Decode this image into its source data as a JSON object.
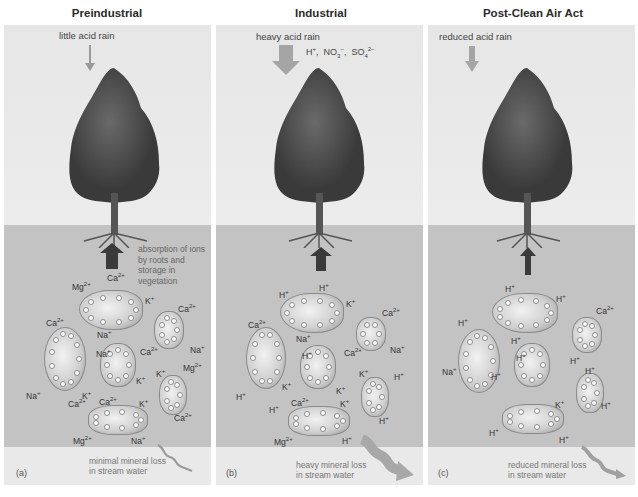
{
  "panels": [
    {
      "letter": "(a)",
      "title": "Preindustrial",
      "rain_label": "little acid rain",
      "absorption_label": "absorption of ions by roots and storage in vegetation",
      "loss_label_1": "minimal mineral loss",
      "loss_label_2": "in stream water",
      "ions": [
        "Mg2+",
        "Ca2+",
        "K+",
        "Ca2+",
        "Ca2+",
        "Na+",
        "Na+",
        "Na+",
        "Ca2+",
        "Na+",
        "K+",
        "K+",
        "K+",
        "Mg2+",
        "Ca2+",
        "Ca2+",
        "K+",
        "Ca2+",
        "Mg2+",
        "Na+"
      ]
    },
    {
      "letter": "(b)",
      "title": "Industrial",
      "rain_label": "heavy acid rain",
      "rain_ions": "H+, NO3−, SO42−",
      "loss_label_1": "heavy mineral loss",
      "loss_label_2": "in stream water",
      "ions": [
        "H+",
        "H+",
        "K+",
        "Ca2+",
        "Ca2+",
        "Na+",
        "Na+",
        "H+",
        "Ca2+",
        "K+",
        "H+",
        "K+",
        "K+",
        "H+",
        "H+",
        "Ca2+",
        "K+",
        "H+",
        "Mg2+",
        "H+"
      ]
    },
    {
      "letter": "(c)",
      "title": "Post-Clean Air Act",
      "rain_label": "reduced acid rain",
      "loss_label_1": "reduced mineral loss",
      "loss_label_2": "in stream water",
      "ions": [
        "H+",
        "H+",
        "H+",
        "Ca2+",
        "H+",
        "Na+",
        "H+",
        "H+",
        "H+",
        "H+",
        "H+",
        "K+",
        "H+",
        "H+",
        "H+"
      ]
    }
  ],
  "colors": {
    "sky": "#e9e9e9",
    "soil": "#c3c3c3",
    "tree": "#4a4a4a",
    "arrow": "#3a3a3a",
    "rain_arrow": "#9a9a9a"
  }
}
